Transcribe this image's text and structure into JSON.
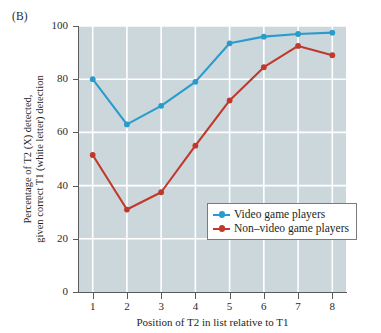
{
  "panel": {
    "label": "(B)"
  },
  "colors": {
    "series_blue": "#2a9ccc",
    "series_red": "#c0392b",
    "plot_background": "#ccd7dc",
    "gridline": "#ffffff",
    "axis": "#5b5b5b",
    "text": "#231f20"
  },
  "legend": {
    "position": "inside-lower-right",
    "entries": [
      {
        "label": "Video game players",
        "color": "#2a9ccc",
        "marker": "diamond-line-marker"
      },
      {
        "label": "Non–video game players",
        "color": "#c0392b",
        "marker": "diamond-line-marker"
      }
    ]
  },
  "axes": {
    "y_ticks": [
      "0",
      "20",
      "40",
      "60",
      "80",
      "100"
    ],
    "x_ticks": [
      "1",
      "2",
      "3",
      "4",
      "5",
      "6",
      "7",
      "8"
    ],
    "y_title_line1": "Percentage of T2 (X) detected,",
    "y_title_line2": "given correct T1 (white letter) detection",
    "x_title": "Position of T2 in list relative to T1"
  },
  "chart_data": {
    "type": "line",
    "title": "(B)",
    "xlabel": "Position of T2 in list relative to T1",
    "ylabel": "Percentage of T2 (X) detected, given correct T1 (white letter) detection",
    "x": [
      1,
      2,
      3,
      4,
      5,
      6,
      7,
      8
    ],
    "xlim": [
      0.6,
      8.4
    ],
    "ylim": [
      0,
      100
    ],
    "grid": true,
    "legend_position": "lower right inside plot",
    "series": [
      {
        "name": "Video game players",
        "color": "#2a9ccc",
        "values": [
          80,
          63,
          70,
          79,
          93.5,
          96,
          97,
          97.5
        ]
      },
      {
        "name": "Non–video game players",
        "color": "#c0392b",
        "values": [
          51.5,
          31,
          37.5,
          55,
          72,
          84.5,
          92.5,
          89
        ]
      }
    ]
  }
}
